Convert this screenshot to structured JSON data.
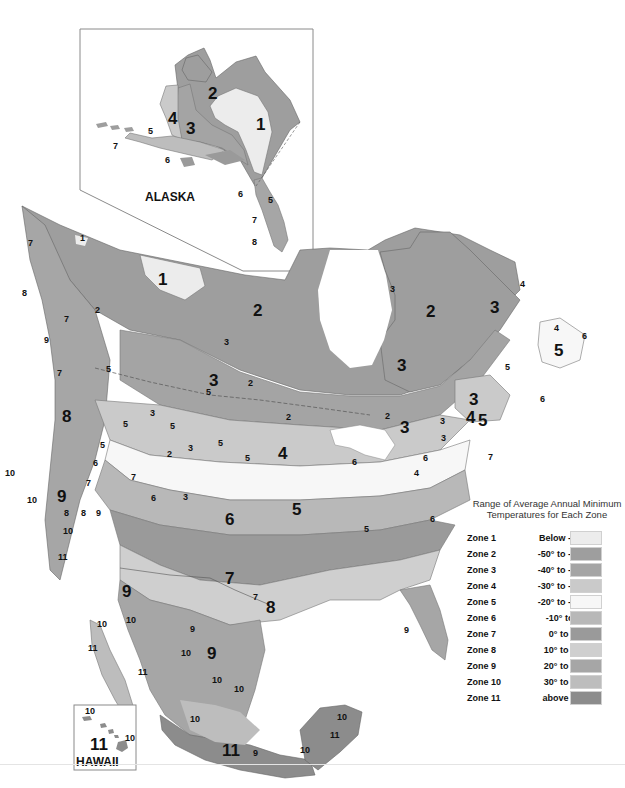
{
  "map": {
    "type": "USDA Plant Hardiness Zone Map (grayscale)",
    "regions": [
      {
        "name": "ALASKA",
        "inset": true
      },
      {
        "name": "HAWAII",
        "inset": true
      }
    ],
    "colors": {
      "zone1": "#ececec",
      "zone2": "#9e9e9e",
      "zone3": "#a4a4a4",
      "zone4": "#cacaca",
      "zone5": "#f7f7f7",
      "zone6": "#b8b8b8",
      "zone7": "#9a9a9a",
      "zone8": "#cfcfcf",
      "zone9": "#a6a6a6",
      "zone10": "#bdbdbd",
      "zone11": "#8c8c8c",
      "border": "#555555",
      "inset_frame": "#8a8a8a"
    },
    "labels": {
      "alaska": {
        "title": "ALASKA",
        "zones": [
          "1",
          "2",
          "3",
          "4",
          "5",
          "6",
          "6",
          "7",
          "5",
          "7",
          "8"
        ]
      },
      "hawaii": {
        "title": "HAWAII",
        "zones": [
          "11",
          "10",
          "10"
        ]
      },
      "mainland": {
        "z1a": "1",
        "z1b": "1",
        "z2a": "2",
        "z2b": "2",
        "z2c": "2",
        "z2d": "2",
        "z2e": "2",
        "z2f": "2",
        "z2g": "2",
        "z3a": "3",
        "z3b": "3",
        "z3c": "3",
        "z3d": "3",
        "z3e": "3",
        "z3f": "3",
        "z3g": "3",
        "z3h": "3",
        "z3i": "3",
        "z3j": "3",
        "z3k": "3",
        "z3l": "3",
        "z4a": "4",
        "z4b": "4",
        "z4c": "4",
        "z4d": "4",
        "z4e": "4",
        "z5a": "5",
        "z5b": "5",
        "z5c": "5",
        "z5d": "5",
        "z5e": "5",
        "z5f": "5",
        "z5g": "5",
        "z5h": "5",
        "z5i": "5",
        "z5j": "5",
        "z5k": "5",
        "z5l": "5",
        "z6a": "6",
        "z6b": "6",
        "z6c": "6",
        "z6d": "6",
        "z6e": "6",
        "z6f": "6",
        "z6g": "6",
        "z6h": "6",
        "z7a": "7",
        "z7b": "7",
        "z7c": "7",
        "z7d": "7",
        "z7e": "7",
        "z7f": "7",
        "z7g": "7",
        "z7h": "7",
        "z8a": "8",
        "z8b": "8",
        "z8c": "8",
        "z8d": "8",
        "z8e": "8",
        "z9a": "9",
        "z9b": "9",
        "z9c": "9",
        "z9d": "9",
        "z9e": "9",
        "z9f": "9",
        "z9g": "9",
        "z9h": "9",
        "z10a": "10",
        "z10b": "10",
        "z10c": "10",
        "z10d": "10",
        "z10e": "10",
        "z10f": "10",
        "z10g": "10",
        "z10h": "10",
        "z10i": "10",
        "z10j": "10",
        "z10k": "10",
        "z11a": "11",
        "z11b": "11",
        "z11c": "11",
        "z11d": "11",
        "z11e": "11"
      }
    }
  },
  "legend": {
    "title_line1": "Range of Average Annual Minimum",
    "title_line2": "Temperatures for Each Zone",
    "zones": [
      {
        "zone": "Zone 1",
        "range": "Below -50°F",
        "color": "#ececec"
      },
      {
        "zone": "Zone 2",
        "range": "-50° to -40°F",
        "color": "#9e9e9e"
      },
      {
        "zone": "Zone 3",
        "range": "-40° to -30°F",
        "color": "#a4a4a4"
      },
      {
        "zone": "Zone 4",
        "range": "-30° to -20°F",
        "color": "#cacaca"
      },
      {
        "zone": "Zone 5",
        "range": "-20° to -10°F",
        "color": "#f7f7f7"
      },
      {
        "zone": "Zone 6",
        "range": "-10° to 0°F",
        "color": "#b8b8b8"
      },
      {
        "zone": "Zone 7",
        "range": "0° to 10°F",
        "color": "#9a9a9a"
      },
      {
        "zone": "Zone 8",
        "range": "10° to 20°F",
        "color": "#cfcfcf"
      },
      {
        "zone": "Zone 9",
        "range": "20° to 30°F",
        "color": "#a6a6a6"
      },
      {
        "zone": "Zone 10",
        "range": "30° to 40°F",
        "color": "#bdbdbd"
      },
      {
        "zone": "Zone 11",
        "range": "above 40°F",
        "color": "#8c8c8c"
      }
    ]
  }
}
